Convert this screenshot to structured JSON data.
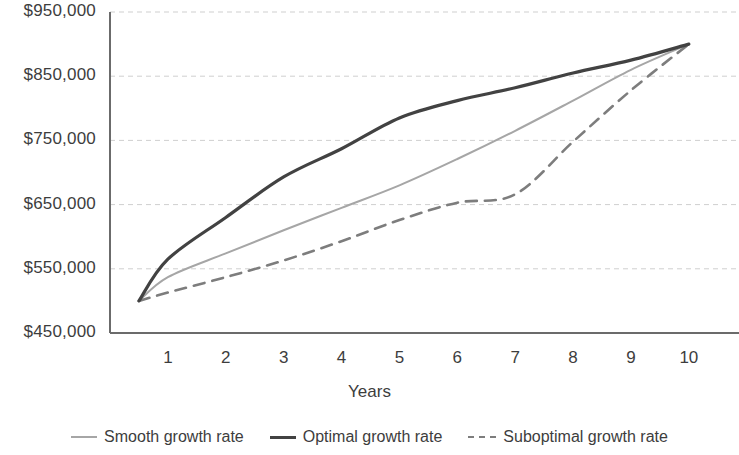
{
  "chart_data": {
    "type": "line",
    "title": "",
    "xlabel": "Years",
    "ylabel": "",
    "x": [
      0.5,
      1,
      2,
      3,
      4,
      5,
      6,
      7,
      8,
      9,
      10
    ],
    "xtick_labels": [
      "1",
      "2",
      "3",
      "4",
      "5",
      "6",
      "7",
      "8",
      "9",
      "10"
    ],
    "ytick_labels": [
      "$950,000",
      "$850,000",
      "$750,000",
      "$650,000",
      "$550,000",
      "$450,000"
    ],
    "ytick_values": [
      950000,
      850000,
      750000,
      650000,
      550000,
      450000
    ],
    "ylim": [
      450000,
      950000
    ],
    "xlim": [
      0,
      10.4
    ],
    "grid": true,
    "legend_position": "bottom",
    "series": [
      {
        "name": "Smooth growth rate",
        "style": "solid",
        "color": "#a6a6a6",
        "width": 2,
        "values": [
          500000,
          537000,
          574000,
          610000,
          645000,
          680000,
          721000,
          765000,
          812000,
          860000,
          900000
        ]
      },
      {
        "name": "Optimal growth rate",
        "style": "solid",
        "color": "#424242",
        "width": 3.2,
        "values": [
          500000,
          565000,
          630000,
          693000,
          737000,
          785000,
          812000,
          832000,
          855000,
          875000,
          900000
        ]
      },
      {
        "name": "Suboptimal growth rate",
        "style": "dashed",
        "color": "#7d7d7d",
        "width": 2.6,
        "values": [
          500000,
          513000,
          537000,
          563000,
          593000,
          626000,
          653000,
          666000,
          748000,
          828000,
          900000
        ]
      }
    ]
  },
  "axis": {
    "x_title": "Years"
  },
  "legend": {
    "items": [
      {
        "label": "Smooth growth rate",
        "swatch": "smooth"
      },
      {
        "label": "Optimal growth rate",
        "swatch": "optimal"
      },
      {
        "label": "Suboptimal growth rate",
        "swatch": "suboptimal"
      }
    ]
  },
  "colors": {
    "smooth": "#a6a6a6",
    "optimal": "#424242",
    "suboptimal": "#7d7d7d",
    "grid": "#cfcfcf",
    "axis": "#6b6b6b",
    "text": "#3d3d3d"
  }
}
